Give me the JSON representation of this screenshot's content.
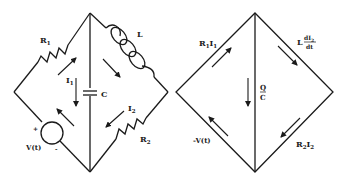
{
  "figure": {
    "circuit": {
      "labels": {
        "R1": "R",
        "R1_sub": "1",
        "R2": "R",
        "R2_sub": "2",
        "L": "L",
        "C": "C",
        "I1": "I",
        "I1_sub": "1",
        "I2": "I",
        "I2_sub": "2",
        "source": "V(t)",
        "plus": "+",
        "minus": "-"
      }
    },
    "voltage_diagram": {
      "labels": {
        "R1I1_a": "R",
        "R1I1_s1": "1",
        "R1I1_b": "I",
        "R1I1_s2": "1",
        "L_pre": "L",
        "dI2_num": "dI",
        "dI2_sub": "2",
        "dt_den": "dt",
        "Q": "Q",
        "C": "C",
        "neg_V": "-V(t)",
        "R2I2_a": "R",
        "R2I2_s1": "2",
        "R2I2_b": "I",
        "R2I2_s2": "2"
      }
    },
    "colors": {
      "ink": "#1a1a1a",
      "background": "#ffffff"
    }
  }
}
